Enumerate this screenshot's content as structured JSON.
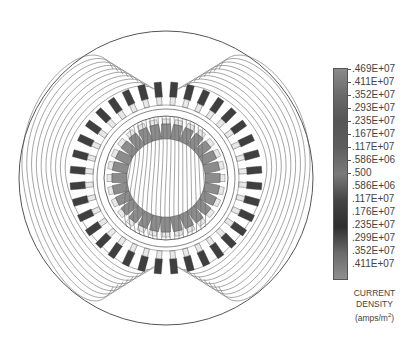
{
  "figure": {
    "type": "finite-element field plot",
    "stator_slot_count": 36,
    "rotor_bar_count": 28
  },
  "legend": {
    "labels": [
      ".469E+07",
      ".411E+07",
      ".352E+07",
      ".293E+07",
      ".235E+07",
      ".167E+07",
      ".117E+07",
      ".586E+06",
      ".500",
      ".586E+06",
      ".117E+07",
      ".176E+07",
      ".235E+07",
      ".299E+07",
      ".352E+07",
      ".411E+07"
    ],
    "caption_line1": "CURRENT",
    "caption_line2": "DENSITY",
    "caption_line3": "(amps/m",
    "caption_sup": "2",
    "caption_close": ")",
    "gradient_colors": [
      "#8a8a8a",
      "#6a6a6a",
      "#555555",
      "#5e5e5e",
      "#7a7a7a",
      "#444444",
      "#2e2e2e",
      "#6a6a6a",
      "#8f8f8f"
    ]
  },
  "colors": {
    "stator_slot_dark": "#3f3f3f",
    "stator_slot_tip": "#e8e8e8",
    "rotor_bar": "#8c8c8c",
    "line": "#6a6a6a",
    "outline": "#555555"
  }
}
